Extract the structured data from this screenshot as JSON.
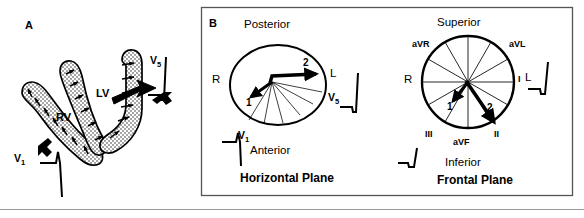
{
  "figure": {
    "type": "medical-diagram",
    "bottom_rule": true,
    "colors": {
      "ink": "#000000",
      "paper": "#ffffff",
      "rule": "#9a9a9a",
      "myocardium_fill": "#ffffff",
      "stipple": "#000000"
    }
  },
  "panel_a": {
    "letter": "A",
    "labels": {
      "rv": "RV",
      "lv": "LV",
      "v1": "V",
      "v1_sub": "1",
      "v5": "V",
      "v5_sub": "5"
    },
    "structures": [
      {
        "name": "right-ventricle-wall",
        "label": "RV"
      },
      {
        "name": "left-ventricle-wall",
        "label": "LV"
      },
      {
        "name": "septum",
        "label": ""
      }
    ],
    "electrodes": [
      {
        "name": "v1-electrode",
        "label": "V1",
        "ecg": "rS complex"
      },
      {
        "name": "v5-electrode",
        "label": "V5",
        "ecg": "qR complex"
      }
    ],
    "activation_arrows": {
      "count": 16,
      "note": "small arrows endocardium to epicardium"
    }
  },
  "panel_b": {
    "letter": "B",
    "horizontal_plane": {
      "title": "Horizontal Plane",
      "orientation": {
        "top": "Posterior",
        "bottom": "Anterior",
        "left": "R",
        "right": "L"
      },
      "vectors": [
        {
          "name": "vector-1",
          "label": "1",
          "direction_deg": 205,
          "weight": "medium"
        },
        {
          "name": "vector-2",
          "label": "2",
          "direction_deg": 355,
          "weight": "heavy"
        }
      ],
      "lead_axes": [
        {
          "label": "V1",
          "name": "v1-axis"
        },
        {
          "label": "V5",
          "name": "v5-axis"
        }
      ],
      "fan_lines": 6,
      "electrodes": [
        {
          "name": "v1-electrode",
          "label": "V",
          "sub": "1",
          "ecg": "rS complex"
        },
        {
          "name": "v5-electrode",
          "label": "V",
          "sub": "5",
          "ecg": "qR complex"
        }
      ]
    },
    "frontal_plane": {
      "title": "Frontal Plane",
      "orientation": {
        "top": "Superior",
        "bottom": "Inferior",
        "left": "R",
        "right": "L"
      },
      "vectors": [
        {
          "name": "vector-1",
          "label": "1",
          "direction_deg": 125,
          "weight": "medium"
        },
        {
          "name": "vector-2",
          "label": "2",
          "direction_deg": 62,
          "weight": "heavy"
        }
      ],
      "lead_axes": [
        {
          "label": "aVR",
          "angle_deg": -150,
          "name": "avr-axis"
        },
        {
          "label": "aVL",
          "angle_deg": -30,
          "name": "avl-axis"
        },
        {
          "label": "I",
          "angle_deg": 0,
          "name": "lead-i-axis"
        },
        {
          "label": "II",
          "angle_deg": 60,
          "name": "lead-ii-axis"
        },
        {
          "label": "III",
          "angle_deg": 120,
          "name": "lead-iii-axis"
        },
        {
          "label": "aVF",
          "angle_deg": 90,
          "name": "avf-axis"
        }
      ],
      "electrodes": [
        {
          "name": "lead-i-ecg",
          "label": "L",
          "ecg": "qR complex"
        },
        {
          "name": "lead-iii-ecg",
          "label": "",
          "ecg": "small q then upstroke"
        }
      ]
    }
  }
}
